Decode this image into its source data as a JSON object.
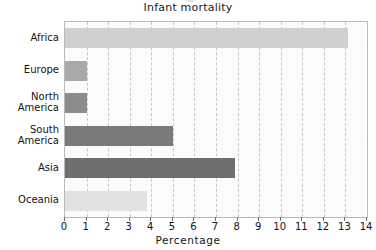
{
  "chart_data": {
    "type": "bar",
    "orientation": "horizontal",
    "title": "Infant mortality",
    "xlabel": "Percentage",
    "ylabel": "",
    "categories": [
      "Africa",
      "Europe",
      "North America",
      "South America",
      "Asia",
      "Oceania"
    ],
    "values": [
      13.1,
      1.0,
      1.0,
      5.0,
      7.9,
      3.8
    ],
    "xlim": [
      0,
      14
    ],
    "ylim": null,
    "xticks": [
      "0",
      "1",
      "2",
      "3",
      "4",
      "5",
      "6",
      "7",
      "8",
      "9",
      "10",
      "11",
      "12",
      "13",
      "14"
    ],
    "grid": "vertical-dashed",
    "legend": "none",
    "bar_colors": [
      "#cfcfcf",
      "#a9a9a9",
      "#8b8b8b",
      "#7a7a7a",
      "#6e6e6e",
      "#e2e2e2"
    ],
    "series": [
      {
        "name": "Infant mortality",
        "points": [
          {
            "category": "Africa",
            "value": 13.1
          },
          {
            "category": "Europe",
            "value": 1.0
          },
          {
            "category": "North America",
            "value": 1.0
          },
          {
            "category": "South America",
            "value": 5.0
          },
          {
            "category": "Asia",
            "value": 7.9
          },
          {
            "category": "Oceania",
            "value": 3.8
          }
        ]
      }
    ]
  },
  "axis": {
    "x_tick_labels": [
      "0",
      "1",
      "2",
      "3",
      "4",
      "5",
      "6",
      "7",
      "8",
      "9",
      "10",
      "11",
      "12",
      "13",
      "14"
    ],
    "y_tick_labels": [
      "Africa",
      "Europe",
      "North\nAmerica",
      "South\nAmerica",
      "Asia",
      "Oceania"
    ],
    "x_title": "Percentage"
  },
  "colors": {
    "plot_background": "#fbfbfb",
    "frame": "#b9b9b9",
    "grid": "#c6c6c6",
    "text": "#141414"
  }
}
